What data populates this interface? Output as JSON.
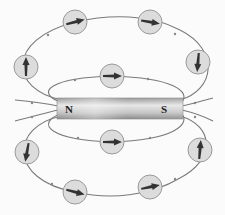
{
  "diagram": {
    "magnet": {
      "north_label": "N",
      "south_label": "S",
      "colors": {
        "light": "#e8e8e8",
        "mid": "#b9b9b9",
        "dark": "#8a8a8a"
      }
    },
    "field_line_color": "#7a7a7a",
    "compass": {
      "fill": "#dcdcdc",
      "stroke": "#9a9a9a",
      "needle_color": "#333333",
      "items": [
        {
          "cx": 75,
          "cy": 22,
          "angle": -15
        },
        {
          "cx": 150,
          "cy": 22,
          "angle": 10
        },
        {
          "cx": 26,
          "cy": 67,
          "angle": -90
        },
        {
          "cx": 198,
          "cy": 62,
          "angle": 95
        },
        {
          "cx": 112,
          "cy": 76,
          "angle": 0
        },
        {
          "cx": 112,
          "cy": 142,
          "angle": 0
        },
        {
          "cx": 27,
          "cy": 152,
          "angle": 100
        },
        {
          "cx": 200,
          "cy": 150,
          "angle": -85
        },
        {
          "cx": 75,
          "cy": 192,
          "angle": 15
        },
        {
          "cx": 150,
          "cy": 187,
          "angle": -12
        }
      ]
    }
  }
}
